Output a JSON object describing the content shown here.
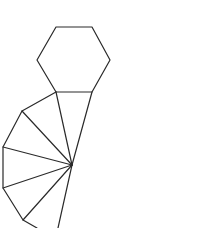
{
  "diagram": {
    "stroke_color": "#2a2a2a",
    "background": "#ffffff",
    "hexagon": {
      "points": "56,27 92,27 110,60 92,92 56,92 37,60"
    },
    "apex": {
      "x": 72,
      "y": 165
    },
    "fan_outline": {
      "points": "56,92 22,111 3,147 3,188 23,220 37,228"
    },
    "spokes": [
      {
        "x": 92,
        "y": 92
      },
      {
        "x": 56,
        "y": 92
      },
      {
        "x": 22,
        "y": 111
      },
      {
        "x": 3,
        "y": 147
      },
      {
        "x": 3,
        "y": 188
      },
      {
        "x": 23,
        "y": 220
      },
      {
        "x": 58,
        "y": 228
      }
    ]
  }
}
